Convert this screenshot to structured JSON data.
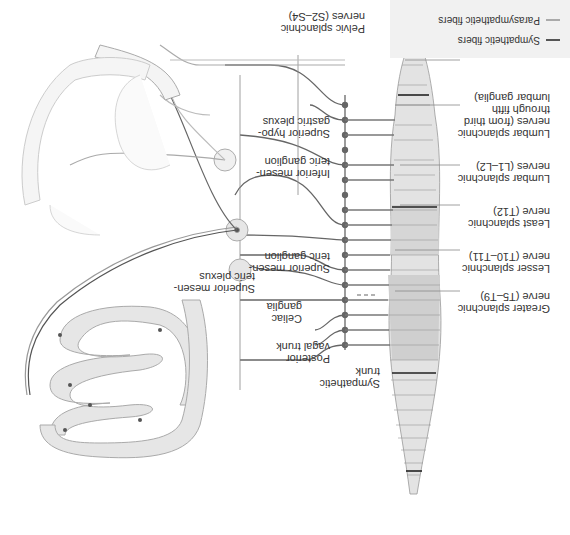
{
  "legend": {
    "items": [
      {
        "label": "Sympathetic fibers",
        "color": "#555555"
      },
      {
        "label": "Parasympathetic fibers",
        "color": "#aaaaaa"
      }
    ]
  },
  "labels": {
    "sympathetic_trunk": "Sympathetic\ntrunk",
    "posterior_vagal_trunk": "Posterior\nvagal trunk",
    "celiac_ganglia": "Celiac\nganglia",
    "superior_mesenteric_ganglion": "Superior mesen-\nteric ganglion",
    "superior_mesenteric_plexus": "Superior mesen-\nteric plexus",
    "inferior_mesenteric_ganglion": "Inferior mesen-\nteric ganglion",
    "superior_hypogastric_plexus": "Superior hypo-\ngastric plexus",
    "pelvic_splanchnic": "Pelvic splanchnic\nnerves (S2–S4)",
    "greater_splanchnic": "Greater splanchnic\nnerve (T5–T9)",
    "lesser_splanchnic": "Lesser splanchnic\nnerve (T10–T11)",
    "least_splanchnic": "Least splanchnic\nnerve (T12)",
    "lumbar_splanchnic_1": "Lumbar splanchnic\nnerves (L1–L2)",
    "lumbar_splanchnic_2": "Lumbar splanchnic\nnerves (from third\nthrough fifth\nlumbar ganglia)",
    "sacral_splanchnic": "Sacral splanchnic\nnerves (from first\nthrough third\nsacral ganglia)"
  },
  "colors": {
    "sympathetic": "#555555",
    "parasympathetic": "#aaaaaa",
    "spinal_fill_dark": "#cfcfcf",
    "spinal_fill_light": "#ececec",
    "organ_fill": "#e8e8e8",
    "organ_stroke": "#b0b0b0"
  }
}
